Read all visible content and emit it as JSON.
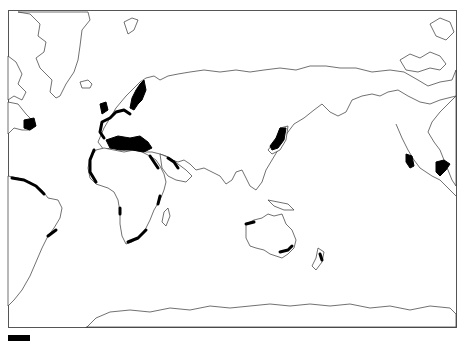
{
  "map": {
    "type": "world outline map (Pacific-centered, Americas split)",
    "frame": {
      "x": 8,
      "y": 10,
      "width": 449,
      "height": 318
    },
    "highlight_color": "#000000",
    "outline_color": "#333333",
    "highlighted_regions": [
      "Western Europe coast / British Isles",
      "Norway / Baltic coast",
      "Mediterranean basin",
      "Northwest Africa (Morocco) coast",
      "Red Sea / Persian Gulf coast",
      "East African coast",
      "South African coast",
      "Japan",
      "Western Australia coast",
      "Southern Australia coast",
      "New Zealand",
      "California / Baja coast",
      "Gulf of Mexico coast",
      "Northern South America coast",
      "Eastern Brazil coast",
      "Central America west coast"
    ]
  },
  "legend": {
    "swatch_color": "#000000",
    "label": ""
  }
}
